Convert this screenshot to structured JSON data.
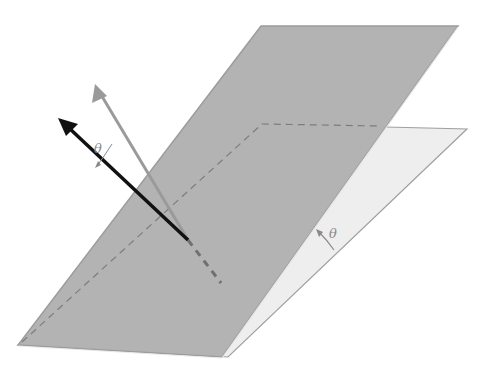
{
  "figure": {
    "type": "3d-planes-with-vectors",
    "labels": {
      "angle_between_vectors": "θ",
      "angle_between_planes": "θ"
    },
    "colors": {
      "background": "#ffffff",
      "front_plane_fill": "#b3b3b3",
      "front_plane_edge": "#9c9c9c",
      "back_plane_fill": "#eeeeee",
      "back_plane_edge": "#a0a0a0",
      "hidden_line": "#7d7d7d",
      "normal_vector_gray": "#9a9a9a",
      "normal_vector_black": "#111111",
      "angle_marker": "#8a8a8a"
    },
    "elements": [
      {
        "name": "tilted-plane",
        "description": "large gray parallelogram plane"
      },
      {
        "name": "reference-plane",
        "description": "light plane partially hidden behind tilted plane"
      },
      {
        "name": "gray-normal-vector",
        "description": "normal of reference plane"
      },
      {
        "name": "black-normal-vector",
        "description": "normal of tilted plane"
      },
      {
        "name": "intersection-line",
        "description": "dashed line where planes meet"
      }
    ]
  }
}
